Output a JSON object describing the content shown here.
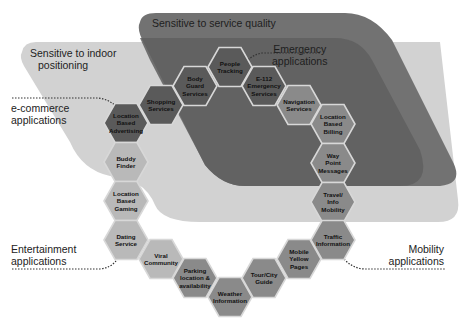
{
  "zones": {
    "service_quality": {
      "label": "Sensitive to service quality",
      "color": "#6e6e6e"
    },
    "emergency": {
      "label_line1": "Emergency",
      "label_line2": "applications",
      "color": "#5e5e5e"
    },
    "indoor_positioning": {
      "label_line1": "Sensitive to indoor",
      "label_line2": "positioning",
      "color": "#cfcfcf"
    }
  },
  "categories": {
    "ecommerce": {
      "line1": "e-commerce",
      "line2": "applications"
    },
    "entertainment": {
      "line1": "Entertainment",
      "line2": "applications"
    },
    "mobility": {
      "line1": "Mobility",
      "line2": "applications"
    }
  },
  "hex_colors": {
    "dark": "#5a5a5a",
    "medium": "#8a8a8a",
    "light": "#b9b9b9",
    "border": "#d8d8d8"
  },
  "hexagons": [
    {
      "id": "location-based-advertising",
      "lines": [
        "Location",
        "Based",
        "Advertising"
      ],
      "x": 126,
      "y": 123,
      "shade": "dark"
    },
    {
      "id": "shopping-services",
      "lines": [
        "Shopping",
        "Services"
      ],
      "x": 161,
      "y": 105,
      "shade": "dark"
    },
    {
      "id": "body-guard-services",
      "lines": [
        "Body",
        "Guard",
        "Services"
      ],
      "x": 195,
      "y": 86,
      "shade": "dark"
    },
    {
      "id": "people-tracking",
      "lines": [
        "People",
        "Tracking"
      ],
      "x": 230,
      "y": 67,
      "shade": "dark"
    },
    {
      "id": "e112-emergency-services",
      "lines": [
        "E-112",
        "Emergency",
        "Services"
      ],
      "x": 264,
      "y": 86,
      "shade": "dark"
    },
    {
      "id": "navigation-services",
      "lines": [
        "Navigation",
        "Services"
      ],
      "x": 299,
      "y": 105,
      "shade": "medium"
    },
    {
      "id": "location-based-billing",
      "lines": [
        "Location",
        "Based",
        "Billing"
      ],
      "x": 333,
      "y": 124,
      "shade": "medium"
    },
    {
      "id": "way-point-messages",
      "lines": [
        "Way",
        "Point",
        "Messages"
      ],
      "x": 333,
      "y": 163,
      "shade": "medium"
    },
    {
      "id": "travel-info-mobility",
      "lines": [
        "Travel/",
        "Info",
        "Mobility"
      ],
      "x": 333,
      "y": 202,
      "shade": "medium"
    },
    {
      "id": "buddy-finder",
      "lines": [
        "Buddy",
        "Finder"
      ],
      "x": 126,
      "y": 162,
      "shade": "light"
    },
    {
      "id": "location-based-gaming",
      "lines": [
        "Location",
        "Based",
        "Gaming"
      ],
      "x": 126,
      "y": 201,
      "shade": "light"
    },
    {
      "id": "dating-service",
      "lines": [
        "Dating",
        "Service"
      ],
      "x": 126,
      "y": 240,
      "shade": "light"
    },
    {
      "id": "viral-community",
      "lines": [
        "Viral",
        "Community"
      ],
      "x": 161,
      "y": 259,
      "shade": "light"
    },
    {
      "id": "parking-location-availability",
      "lines": [
        "Parking",
        "location &",
        "availability"
      ],
      "x": 195,
      "y": 278,
      "shade": "medium"
    },
    {
      "id": "weather-information",
      "lines": [
        "Weather",
        "Information"
      ],
      "x": 230,
      "y": 297,
      "shade": "medium"
    },
    {
      "id": "tour-city-guide",
      "lines": [
        "Tour/City",
        "Guide"
      ],
      "x": 264,
      "y": 278,
      "shade": "medium"
    },
    {
      "id": "mobile-yellow-pages",
      "lines": [
        "Mobile",
        "Yellow",
        "Pages"
      ],
      "x": 299,
      "y": 259,
      "shade": "medium"
    },
    {
      "id": "traffic-information",
      "lines": [
        "Traffic",
        "Information"
      ],
      "x": 333,
      "y": 240,
      "shade": "medium"
    }
  ]
}
